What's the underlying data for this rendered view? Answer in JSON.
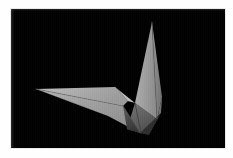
{
  "viewer": {
    "name": "3d-render-viewer",
    "background_color": "#ffffff",
    "canvas_color": "#000000",
    "canvas_left": 11,
    "canvas_top": 9,
    "canvas_width": 214,
    "canvas_height": 139,
    "watermark_text": "",
    "alt_text": "Low-poly folded paper origami bird rendered in grayscale on a black background"
  },
  "render": {
    "title": "Origami crane render",
    "subject": "folded-paper-polygon-model",
    "shading": "flat-faceted-grayscale",
    "light_direction": "upper-left",
    "colors": {
      "background": "#000000",
      "highlight": "#c9c9c9",
      "light": "#b3b3b3",
      "mid_light": "#9e9e9e",
      "mid": "#8a8a8a",
      "mid_dark": "#6f6f6f",
      "dark": "#545454",
      "deep": "#3a3a3a",
      "crease": "#2b2b2b"
    },
    "facets": [
      {
        "name": "head-spike-front",
        "tone_key": "mid_light",
        "fill": "#9b9b9b",
        "points": "141,13 146,110 124,94"
      },
      {
        "name": "head-spike-right",
        "tone_key": "mid",
        "fill": "#8b8b8b",
        "points": "141,13 151,88 146,110"
      },
      {
        "name": "neck-lower-right",
        "tone_key": "mid_dark",
        "fill": "#787878",
        "points": "146,110 151,88 150,104 130,124"
      },
      {
        "name": "body-right-panel",
        "tone_key": "dark",
        "fill": "#606060",
        "points": "124,94 146,110 130,124 116,120"
      },
      {
        "name": "wing-upper-sweep",
        "tone_key": "light",
        "fill": "#b0b0b0",
        "points": "25,80 104,78 117,92 112,97"
      },
      {
        "name": "wing-main",
        "tone_key": "mid_light",
        "fill": "#9d9d9d",
        "points": "25,80 112,97 129,124 97,107"
      },
      {
        "name": "wing-underside",
        "tone_key": "mid_dark",
        "fill": "#7b7b7b",
        "points": "25,80 97,107 66,95"
      },
      {
        "name": "notch-fold-panel",
        "tone_key": "highlight",
        "fill": "#bdbdbd",
        "points": "104,78 124,94 117,92"
      },
      {
        "name": "body-keel",
        "tone_key": "deep",
        "fill": "#4a4a4a",
        "points": "112,97 129,124 116,120"
      },
      {
        "name": "tail-shadow-wedge",
        "tone_key": "crease",
        "fill": "#2f2f2f",
        "points": "129,124 150,104 138,126"
      }
    ],
    "creases": [
      {
        "name": "crease-neck-center",
        "from": "141,13",
        "to": "146,110",
        "color": "#5a5a5a",
        "width": 0.6
      },
      {
        "name": "crease-body-fold",
        "from": "124,94",
        "to": "130,124",
        "color": "#3d3d3d",
        "width": 0.8
      },
      {
        "name": "crease-wing-spine",
        "from": "25,80",
        "to": "112,97",
        "color": "#6e6e6e",
        "width": 0.6
      },
      {
        "name": "crease-notch",
        "from": "104,78",
        "to": "117,92",
        "color": "#8f8f8f",
        "width": 0.6
      },
      {
        "name": "crease-keel",
        "from": "112,97",
        "to": "129,124",
        "color": "#4a4a4a",
        "width": 0.7
      }
    ]
  }
}
